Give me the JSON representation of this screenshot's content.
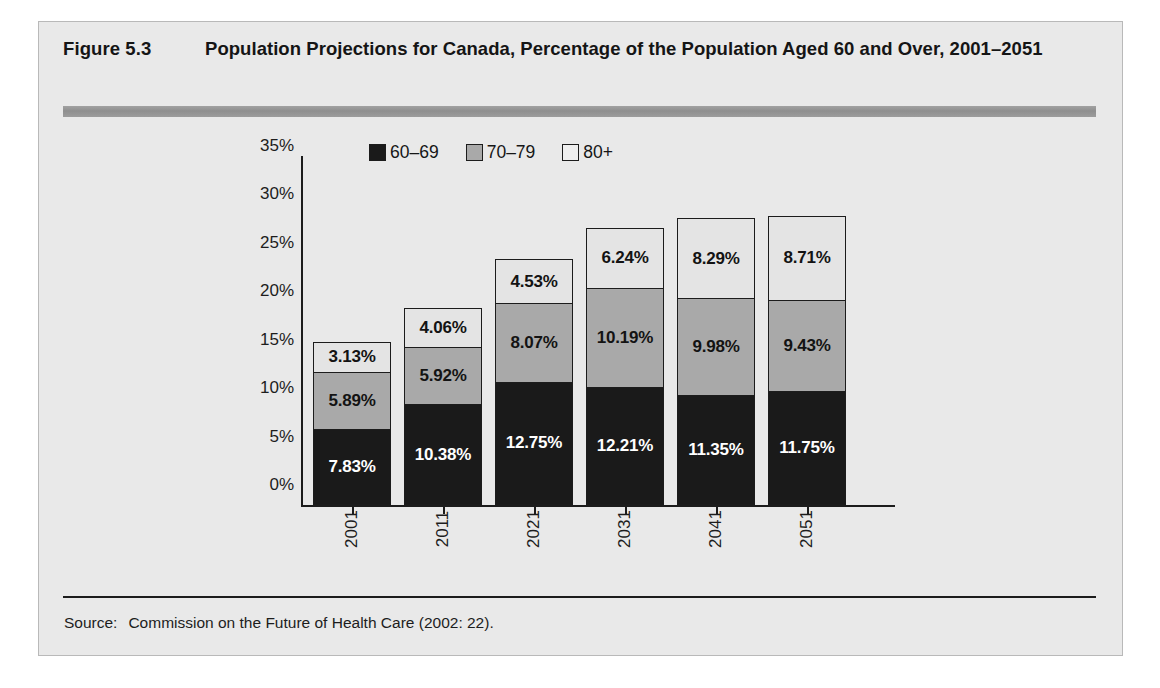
{
  "figure": {
    "number": "Figure 5.3",
    "title": "Population Projections for Canada, Percentage of the Population Aged 60 and Over, 2001–2051",
    "source_label": "Source:",
    "source_text": "Commission on the Future of Health Care (2002: 22)."
  },
  "colors": {
    "panel_background": "#e9e9e9",
    "series_60_69": "#1a1a1a",
    "series_70_79": "#a9a9a9",
    "series_80_plus": "#e4e4e4",
    "axis": "#1c1c1c",
    "header_rule": "#9a9a9a"
  },
  "chart_data": {
    "type": "bar",
    "stacked": true,
    "title": "Population Projections for Canada, Percentage of the Population Aged 60 and Over, 2001–2051",
    "xlabel": "",
    "ylabel": "",
    "categories": [
      "2001",
      "2011",
      "2021",
      "2031",
      "2041",
      "2051"
    ],
    "series": [
      {
        "name": "60–69",
        "color": "#1a1a1a",
        "values": [
          7.83,
          10.38,
          12.75,
          12.21,
          11.35,
          11.75
        ],
        "labels": [
          "7.83%",
          "10.38%",
          "12.75%",
          "12.21%",
          "11.35%",
          "11.75%"
        ]
      },
      {
        "name": "70–79",
        "color": "#a9a9a9",
        "values": [
          5.89,
          5.92,
          8.07,
          10.19,
          9.98,
          9.43
        ],
        "labels": [
          "5.89%",
          "5.92%",
          "8.07%",
          "10.19%",
          "9.98%",
          "9.43%"
        ]
      },
      {
        "name": "80+",
        "color": "#e4e4e4",
        "values": [
          3.13,
          4.06,
          4.53,
          6.24,
          8.29,
          8.71
        ],
        "labels": [
          "3.13%",
          "4.06%",
          "4.53%",
          "6.24%",
          "8.29%",
          "8.71%"
        ]
      }
    ],
    "totals": [
      16.85,
      20.36,
      25.35,
      28.64,
      29.62,
      29.89
    ],
    "ylim": [
      0,
      35
    ],
    "ytick_step": 5,
    "ytick_labels": [
      "0%",
      "5%",
      "10%",
      "15%",
      "20%",
      "25%",
      "30%",
      "35%"
    ],
    "ytick_values": [
      0,
      5,
      10,
      15,
      20,
      25,
      30,
      35
    ],
    "grid": false,
    "legend_position": "top-left-inside",
    "legend_entries": [
      "60–69",
      "70–79",
      "80+"
    ]
  }
}
